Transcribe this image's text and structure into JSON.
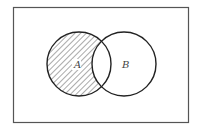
{
  "diagram": {
    "type": "venn",
    "universe": {
      "x": 13,
      "y": 7,
      "width": 175,
      "height": 115,
      "stroke": "#555555"
    },
    "sets": [
      {
        "id": "A",
        "label": "A",
        "cx": 79,
        "cy": 64,
        "r": 32,
        "label_x": 74,
        "label_y": 68
      },
      {
        "id": "B",
        "label": "B",
        "cx": 124,
        "cy": 64,
        "r": 32,
        "label_x": 122,
        "label_y": 68
      }
    ],
    "shaded_region": "A - B",
    "hatch": {
      "direction": "diagonal-down-right",
      "spacing": 4,
      "color": "#555555"
    },
    "colors": {
      "outline": "#222222",
      "background": "#ffffff"
    }
  }
}
